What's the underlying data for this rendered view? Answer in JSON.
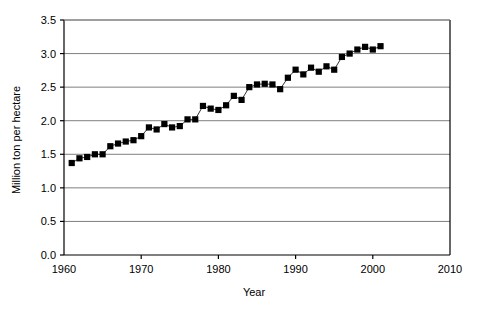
{
  "chart_data": {
    "type": "scatter",
    "title": "",
    "subtitle": "",
    "xlabel": "Year",
    "ylabel": "Million ton per hectare",
    "xlim": [
      1960,
      2010
    ],
    "ylim": [
      0.0,
      3.5
    ],
    "xticks": [
      1960,
      1970,
      1980,
      1990,
      2000,
      2010
    ],
    "xtick_labels": [
      "1960",
      "1970",
      "1980",
      "1990",
      "2000",
      "2010"
    ],
    "yticks": [
      0.0,
      0.5,
      1.0,
      1.5,
      2.0,
      2.5,
      3.0,
      3.5
    ],
    "ytick_labels": [
      "0.0",
      "0.5",
      "1.0",
      "1.5",
      "2.0",
      "2.5",
      "3.0",
      "3.5"
    ],
    "grid": "horizontal",
    "legend": "none",
    "marker": "filled-square",
    "marker_color": "#000000",
    "line_color": "#000000",
    "series": [
      {
        "name": "Yield",
        "x": [
          1961,
          1962,
          1963,
          1964,
          1965,
          1966,
          1967,
          1968,
          1969,
          1970,
          1971,
          1972,
          1973,
          1974,
          1975,
          1976,
          1977,
          1978,
          1979,
          1980,
          1981,
          1982,
          1983,
          1984,
          1985,
          1986,
          1987,
          1988,
          1989,
          1990,
          1991,
          1992,
          1993,
          1994,
          1995,
          1996,
          1997,
          1998,
          1999,
          2000,
          2001
        ],
        "y": [
          1.37,
          1.44,
          1.46,
          1.5,
          1.5,
          1.62,
          1.66,
          1.69,
          1.71,
          1.77,
          1.9,
          1.87,
          1.95,
          1.9,
          1.92,
          2.02,
          2.02,
          2.22,
          2.18,
          2.16,
          2.23,
          2.37,
          2.31,
          2.5,
          2.54,
          2.55,
          2.54,
          2.47,
          2.64,
          2.76,
          2.69,
          2.79,
          2.73,
          2.81,
          2.76,
          2.95,
          3.0,
          3.06,
          3.1,
          3.06,
          3.11
        ]
      }
    ]
  },
  "axis": {
    "x_title": "Year",
    "y_title": "Million ton per hectare"
  }
}
